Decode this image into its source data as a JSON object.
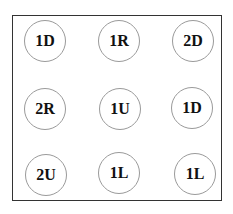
{
  "grid": {
    "rows": 3,
    "cols": 3,
    "cells": [
      {
        "label": "1D"
      },
      {
        "label": "1R"
      },
      {
        "label": "2D"
      },
      {
        "label": "2R"
      },
      {
        "label": "1U"
      },
      {
        "label": "1D"
      },
      {
        "label": "2U"
      },
      {
        "label": "1L"
      },
      {
        "label": "1L"
      }
    ]
  }
}
